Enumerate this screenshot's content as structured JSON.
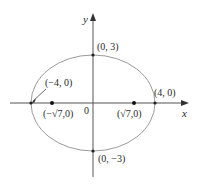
{
  "figure": {
    "type": "ellipse-diagram",
    "colors": {
      "ellipse": "#9a9a9a",
      "axes": "#555555",
      "points": "#222222",
      "text": "#2a2a2a"
    },
    "axes": {
      "x_label": "x",
      "y_label": "y",
      "origin_label": "0"
    },
    "ellipse": {
      "center_px": [
        93,
        103
      ],
      "rx_px": 62,
      "ry_px": 48,
      "note": "rx_px and ry_px were measured from the screenshot; the drawing is not strictly to the 4:3 scale implied by the labels"
    },
    "points": [
      {
        "id": "vertex-left",
        "label": "(−4, 0)",
        "x": -4,
        "y": 0
      },
      {
        "id": "vertex-right",
        "label": "(4, 0)",
        "x": 4,
        "y": 0
      },
      {
        "id": "covertex-top",
        "label": "(0, 3)",
        "x": 0,
        "y": 3
      },
      {
        "id": "covertex-bottom",
        "label": "(0, −3)",
        "x": 0,
        "y": -3
      },
      {
        "id": "focus-left",
        "label": "(−√7,0)",
        "x": "-sqrt(7)",
        "y": 0
      },
      {
        "id": "focus-right",
        "label": "(√7,0)",
        "x": "sqrt(7)",
        "y": 0
      }
    ]
  }
}
